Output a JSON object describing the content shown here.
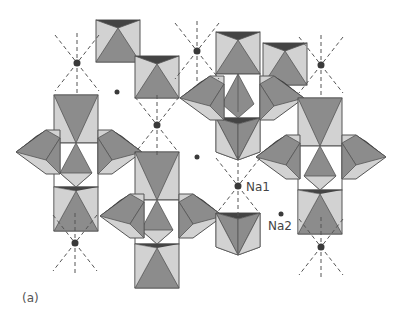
{
  "figure": {
    "panel_label": "(a)",
    "colors": {
      "background": "#ffffff",
      "face_dark": "#8a8a8a",
      "face_mid": "#9a9a9a",
      "face_light": "#cfcfcf",
      "edge": "#555555",
      "top_shadow": "#3f3f3f",
      "atom": "#3a3a3a",
      "dashed_bond": "#555555"
    }
  },
  "labels": {
    "na1": "Na1",
    "na2": "Na2"
  },
  "sites": {
    "na1_positions": [
      [
        77,
        63
      ],
      [
        157,
        125
      ],
      [
        197,
        51
      ],
      [
        321,
        65
      ],
      [
        238,
        186
      ],
      [
        75,
        243
      ],
      [
        321,
        247
      ]
    ],
    "na2_positions": [
      [
        117,
        92
      ],
      [
        197,
        157
      ],
      [
        281,
        214
      ]
    ]
  }
}
